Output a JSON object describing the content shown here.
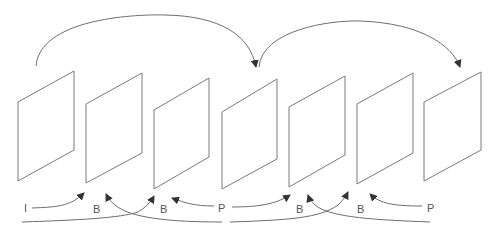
{
  "diagram": {
    "title": "",
    "frames": [
      {
        "id": 1,
        "points": "18,102 74,71 74,150 18,181"
      },
      {
        "id": 2,
        "points": "86,104 142,73 142,153 86,183"
      },
      {
        "id": 3,
        "points": "154,110 209,78 209,157 154,189"
      },
      {
        "id": 4,
        "points": "222,112 277,79 277,159 222,189"
      },
      {
        "id": 5,
        "points": "289,107 345,76 345,155 289,187"
      },
      {
        "id": 6,
        "points": "357,104 413,73 413,153 357,184"
      },
      {
        "id": 7,
        "points": "424,102 481,72 481,150 424,181"
      }
    ],
    "labels": [
      {
        "text": "I",
        "x": 24,
        "y": 212
      },
      {
        "text": "B",
        "x": 93,
        "y": 213
      },
      {
        "text": "B",
        "x": 160,
        "y": 213
      },
      {
        "text": "P",
        "x": 218,
        "y": 212
      },
      {
        "text": "B",
        "x": 296,
        "y": 213
      },
      {
        "text": "B",
        "x": 357,
        "y": 213
      },
      {
        "text": "P",
        "x": 427,
        "y": 212
      }
    ],
    "frame_types": [
      "I",
      "B",
      "B",
      "P",
      "B",
      "B",
      "P"
    ],
    "prediction_arcs": [
      {
        "from": "I",
        "to": "P",
        "description": "I-frame predicts first P-frame"
      },
      {
        "from": "P",
        "to": "P",
        "description": "P-frame predicts next P-frame"
      }
    ]
  }
}
